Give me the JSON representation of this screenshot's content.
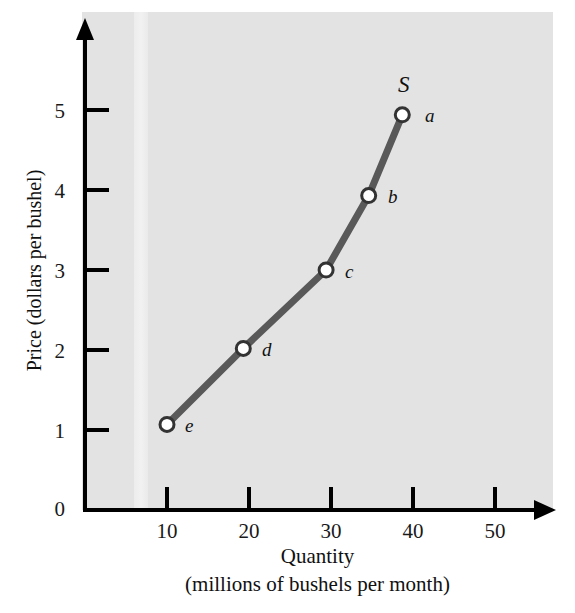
{
  "chart_data": {
    "type": "line",
    "title": "",
    "xlabel": "Quantity",
    "xlabel_sub": "(millions of bushels per month)",
    "ylabel": "Price (dollars per bushel)",
    "grid": false,
    "legend": "none",
    "curve_label": "S",
    "curve_name": "Supply",
    "xlim": [
      0,
      56
    ],
    "ylim": [
      0,
      6.2
    ],
    "xticks": [
      "10",
      "20",
      "30",
      "40",
      "50"
    ],
    "xtick_values": [
      10,
      20,
      30,
      40,
      50
    ],
    "yticks": [
      "0",
      "1",
      "2",
      "3",
      "4",
      "5"
    ],
    "ytick_values": [
      0,
      1,
      2,
      3,
      4,
      5
    ],
    "series": [
      {
        "name": "Supply",
        "points": [
          {
            "label": "e",
            "x": 10.0,
            "y": 1.07
          },
          {
            "label": "d",
            "x": 19.3,
            "y": 2.02
          },
          {
            "label": "c",
            "x": 29.4,
            "y": 3.0
          },
          {
            "label": "b",
            "x": 34.6,
            "y": 3.93
          },
          {
            "label": "a",
            "x": 38.7,
            "y": 4.94
          }
        ]
      }
    ],
    "colors": {
      "plot_background": "#e3e3e3",
      "curve": "#595959",
      "axis": "#000000",
      "marker_fill": "#ffffff",
      "marker_stroke": "#333333",
      "text": "#111111"
    }
  }
}
